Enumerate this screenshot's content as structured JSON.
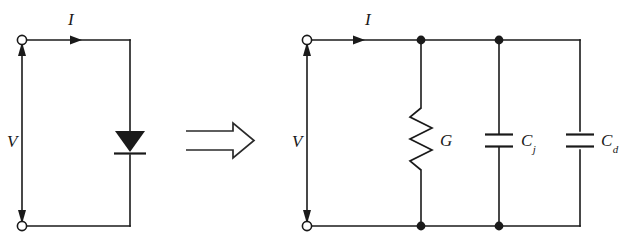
{
  "figure": {
    "background_color": "#ffffff",
    "line_color": "#1a1a1a"
  },
  "left_circuit": {
    "name": "diode-circuit",
    "current_label": "I",
    "voltage_label": "V",
    "component": {
      "type": "diode",
      "name": "diode-symbol"
    },
    "terminals": [
      "top-terminal",
      "bottom-terminal"
    ]
  },
  "transform": {
    "symbol": "implies-arrow",
    "glyph": "⟹"
  },
  "right_circuit": {
    "name": "equivalent-circuit",
    "current_label": "I",
    "voltage_label": "V",
    "components": [
      {
        "type": "resistor",
        "name": "conductance-G",
        "label": "G",
        "sub": ""
      },
      {
        "type": "capacitor",
        "name": "junction-capacitance-Cj",
        "label": "C",
        "sub": "j"
      },
      {
        "type": "capacitor",
        "name": "diffusion-capacitance-Cd",
        "label": "C",
        "sub": "d"
      }
    ],
    "terminals": [
      "top-terminal",
      "bottom-terminal"
    ],
    "nodes": [
      "node-1-top",
      "node-2-top",
      "node-1-bottom",
      "node-2-bottom"
    ]
  }
}
